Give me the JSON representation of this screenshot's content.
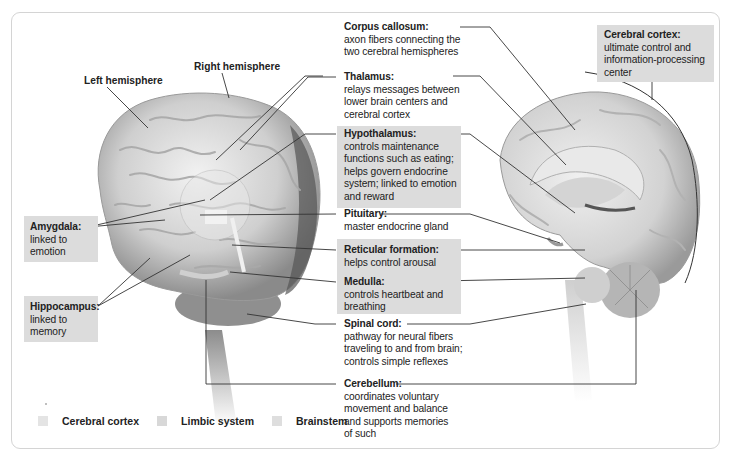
{
  "hemisphere_labels": {
    "left": "Left hemisphere",
    "right": "Right hemisphere"
  },
  "labels": {
    "corpus_callosum": {
      "title": "Corpus callosum:",
      "desc": "axon fibers connecting the two cerebral hemispheres"
    },
    "thalamus": {
      "title": "Thalamus:",
      "desc": "relays messages between lower brain centers and cerebral cortex"
    },
    "hypothalamus": {
      "title": "Hypothalamus:",
      "desc": "controls maintenance functions such as eating; helps govern endocrine system; linked to emotion and reward"
    },
    "pituitary": {
      "title": "Pituitary:",
      "desc": "master endocrine gland"
    },
    "reticular_formation": {
      "title": "Reticular formation:",
      "desc": "helps control arousal"
    },
    "medulla": {
      "title": "Medulla:",
      "desc": "controls heartbeat and breathing"
    },
    "spinal_cord": {
      "title": "Spinal cord:",
      "desc": "pathway for neural fibers traveling to and from brain; controls simple reflexes"
    },
    "cerebellum": {
      "title": "Cerebellum:",
      "desc": "coordinates voluntary movement and balance and supports memories of such"
    },
    "cerebral_cortex": {
      "title": "Cerebral cortex:",
      "desc": "ultimate control and information-processing center"
    },
    "amygdala": {
      "title": "Amygdala:",
      "desc": "linked to emotion"
    },
    "hippocampus": {
      "title": "Hippocampus:",
      "desc": "linked to memory"
    }
  },
  "legend": [
    {
      "label": "Cerebral cortex",
      "color": "#e4e4e4"
    },
    {
      "label": "Limbic system",
      "color": "#d8d8d8"
    },
    {
      "label": "Brainstem",
      "color": "#dedede"
    }
  ],
  "colors": {
    "label_box": "#dcdcdc",
    "leader_line": "#333333",
    "panel_border": "#d4d4d4"
  }
}
